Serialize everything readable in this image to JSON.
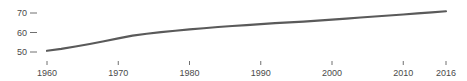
{
  "chart_data": {
    "type": "line",
    "title": "",
    "subtitle": "",
    "xlabel": "",
    "ylabel": "",
    "grid": false,
    "legend": false,
    "legend_position": "none",
    "line_color": "#5a5a5a",
    "axis_text_color": "#4a4a4a",
    "background_color": "#ffffff",
    "xlim": [
      1960,
      2016
    ],
    "ylim": [
      45,
      74
    ],
    "xticks": [
      1960,
      1970,
      1980,
      1990,
      2000,
      2010,
      2016
    ],
    "xtick_labels": [
      "1960",
      "1970",
      "1980",
      "1990",
      "2000",
      "2010",
      "2016"
    ],
    "yticks": [
      50,
      60,
      70
    ],
    "ytick_labels": [
      "50",
      "60",
      "70"
    ],
    "series": [
      {
        "name": "",
        "x": [
          1960,
          1962,
          1964,
          1966,
          1968,
          1970,
          1972,
          1974,
          1976,
          1978,
          1980,
          1982,
          1984,
          1986,
          1988,
          1990,
          1992,
          1994,
          1996,
          1998,
          2000,
          2002,
          2004,
          2006,
          2008,
          2010,
          2012,
          2014,
          2016
        ],
        "values": [
          50.6,
          51.6,
          52.8,
          54.1,
          55.5,
          57.0,
          58.4,
          59.4,
          60.2,
          60.9,
          61.6,
          62.2,
          62.8,
          63.3,
          63.8,
          64.3,
          64.8,
          65.2,
          65.6,
          66.1,
          66.6,
          67.1,
          67.7,
          68.2,
          68.7,
          69.2,
          69.8,
          70.3,
          70.9
        ]
      }
    ]
  }
}
